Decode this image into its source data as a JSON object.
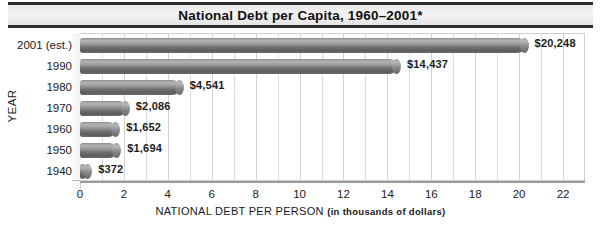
{
  "chart_data": {
    "type": "bar",
    "orientation": "horizontal",
    "title": "National Debt per Capita, 1960–2001*",
    "xlabel_main": "NATIONAL DEBT PER PERSON",
    "xlabel_sub": "(in thousands of dollars)",
    "ylabel": "YEAR",
    "categories": [
      "2001 (est.)",
      "1990",
      "1980",
      "1970",
      "1960",
      "1950",
      "1940"
    ],
    "values": [
      20.248,
      14.437,
      4.541,
      2.086,
      1.652,
      1.694,
      0.372
    ],
    "value_labels": [
      "$20,248",
      "$14,437",
      "$4,541",
      "$2,086",
      "$1,652",
      "$1,694",
      "$372"
    ],
    "xlim": [
      0,
      23
    ],
    "xticks": [
      0,
      2,
      4,
      6,
      8,
      10,
      12,
      14,
      16,
      18,
      20,
      22
    ],
    "xtick_labels": [
      "0",
      "2",
      "4",
      "6",
      "8",
      "10",
      "12",
      "14",
      "16",
      "18",
      "20",
      "22"
    ],
    "minor_gridline_step": 1,
    "grid": true,
    "legend": "none",
    "bar_color": "#7d7d7d",
    "title_background": "#ebebeb",
    "plot_background": "#ffffff",
    "gridline_color": "#dcdcdc"
  }
}
